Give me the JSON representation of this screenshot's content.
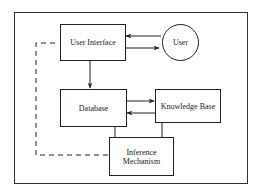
{
  "diagram": {
    "type": "block-diagram",
    "nodes": {
      "user_interface": {
        "label": "User Interface"
      },
      "user": {
        "label": "User"
      },
      "database": {
        "label": "Database"
      },
      "knowledge_base": {
        "label": "Knowledge Base"
      },
      "inference_mechanism": {
        "label": "Inference\nMechanism"
      }
    },
    "edges": [
      {
        "from": "user",
        "to": "user_interface",
        "style": "solid-arrow"
      },
      {
        "from": "user_interface",
        "to": "user",
        "style": "solid-arrow"
      },
      {
        "from": "user_interface",
        "to": "database",
        "style": "solid-arrow"
      },
      {
        "from": "database",
        "to": "knowledge_base",
        "style": "solid-arrow"
      },
      {
        "from": "knowledge_base",
        "to": "database",
        "style": "solid-arrow"
      },
      {
        "from": "database",
        "to": "inference_mechanism",
        "style": "solid-line"
      },
      {
        "from": "knowledge_base",
        "to": "inference_mechanism",
        "style": "solid-line"
      },
      {
        "from": "user_interface",
        "to": "inference_mechanism",
        "style": "dashed-line"
      }
    ],
    "colors": {
      "stroke": "#222222",
      "background": "#ffffff"
    }
  }
}
